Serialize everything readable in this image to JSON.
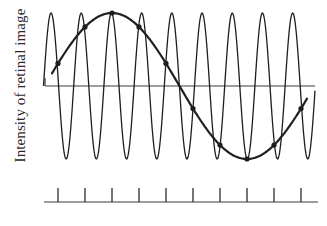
{
  "figure": {
    "ylabel": "Intensity of retinal image",
    "colors": {
      "ink": "#1e1e1e",
      "background": "#ffffff"
    }
  },
  "chart_data": {
    "type": "line",
    "title": "",
    "xlabel": "",
    "ylabel": "Intensity of retinal image",
    "grid": false,
    "legend": false,
    "series": [
      {
        "name": "high-frequency grating",
        "cycles": 9,
        "amplitude": 1.0,
        "offset": 0.0
      },
      {
        "name": "low-frequency alias",
        "cycles": 1,
        "amplitude": 1.0,
        "offset": 0.0,
        "sampled_points": true
      }
    ],
    "sample_ticks": 10,
    "ylim": [
      -1,
      1
    ]
  }
}
